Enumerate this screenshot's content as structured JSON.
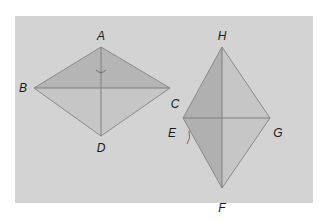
{
  "figure": {
    "background_color": "#d3d3d3",
    "shade_light": "#c4c4c4",
    "shade_dark": "#b0b0b0",
    "line_color": "#8a8a8a",
    "rhombus_1": {
      "labels": {
        "top": "A",
        "left": "B",
        "bottom": "D"
      }
    },
    "rhombus_2": {
      "labels": {
        "top": "H",
        "left_upper": "C",
        "left": "E",
        "right": "G",
        "bottom": "F"
      }
    }
  }
}
